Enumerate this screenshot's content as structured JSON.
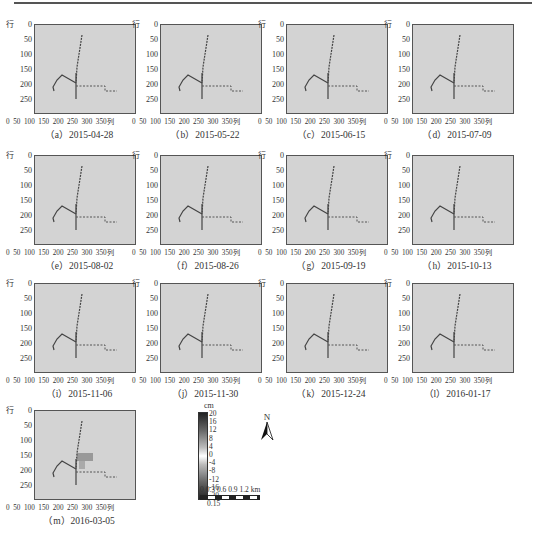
{
  "figure": {
    "y_axis_label": "行",
    "x_axis_label": "列",
    "y_ticks": [
      "0",
      "50",
      "100",
      "150",
      "200",
      "250"
    ],
    "x_ticks": [
      "0",
      "50",
      "100",
      "150",
      "200",
      "250",
      "300",
      "350"
    ],
    "panels": [
      {
        "label": "（a）2015-04-28"
      },
      {
        "label": "（b）2015-05-22"
      },
      {
        "label": "（c）2015-06-15"
      },
      {
        "label": "（d）2015-07-09"
      },
      {
        "label": "（e）2015-08-02"
      },
      {
        "label": "（f）2015-08-26"
      },
      {
        "label": "（g）2015-09-19"
      },
      {
        "label": "（h）2015-10-13"
      },
      {
        "label": "（i）2015-11-06"
      },
      {
        "label": "（j）2015-11-30"
      },
      {
        "label": "（k）2015-12-24"
      },
      {
        "label": "（l）2016-01-17"
      },
      {
        "label": "（m）2016-03-05"
      }
    ],
    "colorbar": {
      "unit": "cm",
      "ticks": [
        "20",
        "16",
        "12",
        "8",
        "4",
        "0",
        "-4",
        "-8",
        "-12",
        "-16",
        "-20"
      ]
    },
    "north_arrow": "N",
    "scale_bar": {
      "labels": "0   0.3 0.6 0.9 1.2 km",
      "sub_label": "0.15"
    }
  }
}
